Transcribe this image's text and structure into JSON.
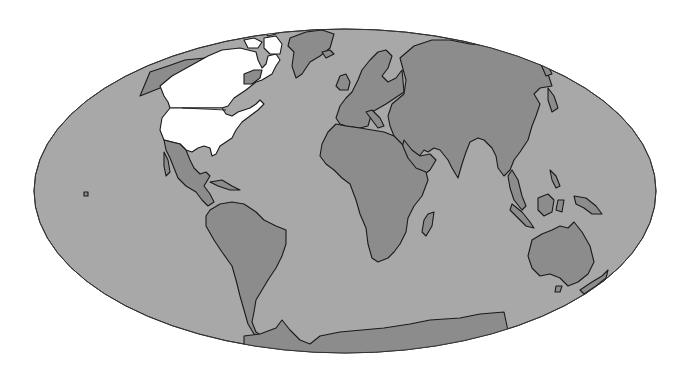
{
  "map": {
    "projection": "mollweide-like ellipse",
    "colors": {
      "background": "#ffffff",
      "ocean": "#a8a8a8",
      "land": "#8c8c8c",
      "highlight": "#ffffff",
      "outline": "#1a1a1a"
    },
    "highlighted_regions": [
      "Canada",
      "United States"
    ],
    "regions": [
      {
        "name": "Canada",
        "highlighted": true
      },
      {
        "name": "United States",
        "highlighted": true
      },
      {
        "name": "Alaska",
        "highlighted": false
      },
      {
        "name": "Greenland",
        "highlighted": false
      },
      {
        "name": "Mexico and Central America",
        "highlighted": false
      },
      {
        "name": "South America",
        "highlighted": false
      },
      {
        "name": "Europe",
        "highlighted": false
      },
      {
        "name": "Africa",
        "highlighted": false
      },
      {
        "name": "Madagascar",
        "highlighted": false
      },
      {
        "name": "Asia",
        "highlighted": false
      },
      {
        "name": "Indonesia and Southeast Asia",
        "highlighted": false
      },
      {
        "name": "Australia",
        "highlighted": false
      },
      {
        "name": "New Zealand",
        "highlighted": false
      },
      {
        "name": "Antarctica",
        "highlighted": false
      }
    ]
  }
}
